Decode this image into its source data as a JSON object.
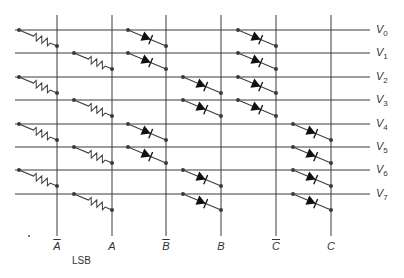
{
  "diagram": {
    "type": "diode-resistor decoder matrix",
    "rows": [
      {
        "label": "V",
        "sub": "0",
        "y": 30
      },
      {
        "label": "V",
        "sub": "1",
        "y": 53
      },
      {
        "label": "V",
        "sub": "2",
        "y": 77
      },
      {
        "label": "V",
        "sub": "3",
        "y": 100
      },
      {
        "label": "V",
        "sub": "4",
        "y": 124
      },
      {
        "label": "V",
        "sub": "5",
        "y": 147
      },
      {
        "label": "V",
        "sub": "6",
        "y": 170
      },
      {
        "label": "V",
        "sub": "7",
        "y": 194
      }
    ],
    "columns": [
      {
        "label": "A",
        "complement": true,
        "x": 57
      },
      {
        "label": "A",
        "complement": false,
        "x": 112
      },
      {
        "label": "B",
        "complement": true,
        "x": 166
      },
      {
        "label": "B",
        "complement": false,
        "x": 221
      },
      {
        "label": "C",
        "complement": true,
        "x": 276
      },
      {
        "label": "C",
        "complement": false,
        "x": 331
      }
    ],
    "lsb_label": "LSB",
    "connections": [
      {
        "row": 0,
        "col": 0,
        "element": "resistor"
      },
      {
        "row": 0,
        "col": 2,
        "element": "diode"
      },
      {
        "row": 0,
        "col": 4,
        "element": "diode"
      },
      {
        "row": 1,
        "col": 1,
        "element": "resistor"
      },
      {
        "row": 1,
        "col": 2,
        "element": "diode"
      },
      {
        "row": 1,
        "col": 4,
        "element": "diode"
      },
      {
        "row": 2,
        "col": 0,
        "element": "resistor"
      },
      {
        "row": 2,
        "col": 3,
        "element": "diode"
      },
      {
        "row": 2,
        "col": 4,
        "element": "diode"
      },
      {
        "row": 3,
        "col": 1,
        "element": "resistor"
      },
      {
        "row": 3,
        "col": 3,
        "element": "diode"
      },
      {
        "row": 3,
        "col": 4,
        "element": "diode"
      },
      {
        "row": 4,
        "col": 0,
        "element": "resistor"
      },
      {
        "row": 4,
        "col": 2,
        "element": "diode"
      },
      {
        "row": 4,
        "col": 5,
        "element": "diode"
      },
      {
        "row": 5,
        "col": 1,
        "element": "resistor"
      },
      {
        "row": 5,
        "col": 2,
        "element": "diode"
      },
      {
        "row": 5,
        "col": 5,
        "element": "diode"
      },
      {
        "row": 6,
        "col": 0,
        "element": "resistor"
      },
      {
        "row": 6,
        "col": 3,
        "element": "diode"
      },
      {
        "row": 6,
        "col": 5,
        "element": "diode"
      },
      {
        "row": 7,
        "col": 1,
        "element": "resistor"
      },
      {
        "row": 7,
        "col": 3,
        "element": "diode"
      },
      {
        "row": 7,
        "col": 5,
        "element": "diode"
      }
    ]
  },
  "colors": {
    "line": "#3a3a3a",
    "text": "#333333",
    "background": "#ffffff"
  }
}
